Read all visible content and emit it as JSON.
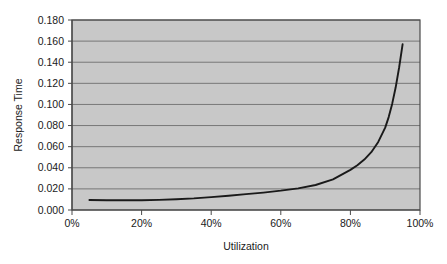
{
  "chart_data": {
    "type": "line",
    "title": "",
    "xlabel": "Utilization",
    "ylabel": "Response Time",
    "xlim": [
      0,
      100
    ],
    "ylim": [
      0.0,
      0.18
    ],
    "grid": "horizontal",
    "legend": "none",
    "x_tick_labels": [
      "0%",
      "20%",
      "40%",
      "60%",
      "80%",
      "100%"
    ],
    "x_tick_values": [
      0,
      20,
      40,
      60,
      80,
      100
    ],
    "y_tick_labels": [
      "0.000",
      "0.020",
      "0.040",
      "0.060",
      "0.080",
      "0.100",
      "0.120",
      "0.140",
      "0.160",
      "0.180"
    ],
    "y_tick_values": [
      0.0,
      0.02,
      0.04,
      0.06,
      0.08,
      0.1,
      0.12,
      0.14,
      0.16,
      0.18
    ],
    "series": [
      {
        "name": "Response Time",
        "color": "#1a1a1a",
        "x": [
          5,
          10,
          15,
          20,
          25,
          30,
          35,
          40,
          45,
          50,
          55,
          60,
          65,
          70,
          75,
          80,
          82,
          84,
          86,
          88,
          90,
          91,
          92,
          93,
          94,
          95
        ],
        "y": [
          0.0095,
          0.0093,
          0.0092,
          0.0092,
          0.0096,
          0.0102,
          0.011,
          0.0122,
          0.0135,
          0.015,
          0.0165,
          0.0183,
          0.0205,
          0.0237,
          0.029,
          0.038,
          0.0424,
          0.0478,
          0.0548,
          0.0645,
          0.078,
          0.088,
          0.1005,
          0.116,
          0.135,
          0.157
        ]
      }
    ]
  },
  "axes": {
    "y_title": "Response Time",
    "x_title": "Utilization"
  },
  "style": {
    "plot_background": "#c8c8c8",
    "plot_border": "#4a4a4a",
    "gridline_color": "#6e6e6e",
    "line_color": "#1a1a1a",
    "page_background": "#ffffff",
    "text_color": "#1a1a1a"
  }
}
